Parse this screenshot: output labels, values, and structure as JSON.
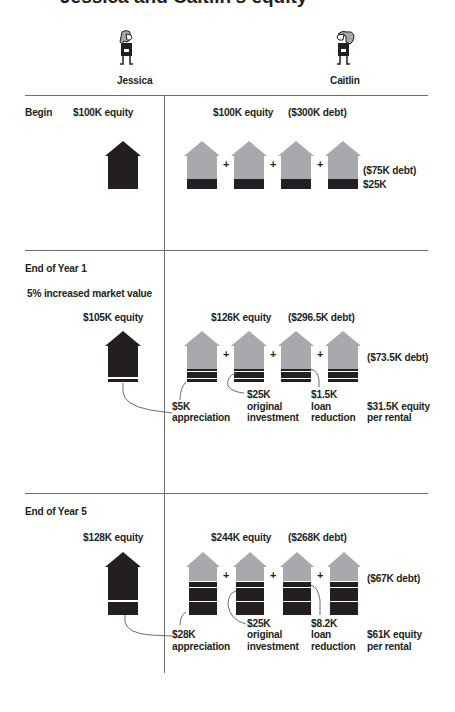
{
  "title": "Jessica and Caitlin's equity",
  "people": {
    "left": {
      "name": "Jessica",
      "icon": "woman-figure-icon"
    },
    "right": {
      "name": "Caitlin",
      "icon": "woman-ponytail-figure-icon"
    }
  },
  "colors": {
    "equity": "#231f20",
    "debt": "#a7a9ac",
    "rule": "#6d6d6d"
  },
  "sections": {
    "begin": {
      "label": "Begin",
      "left_equity": "$100K equity",
      "right_equity": "$100K equity",
      "right_debt": "($300K debt)",
      "per_house_debt": "($75K debt)",
      "per_house_equity": "$25K"
    },
    "year1": {
      "label": "End of Year 1",
      "note": "5% increased market value",
      "left_equity": "$105K equity",
      "right_equity": "$126K equity",
      "right_debt": "($296.5K debt)",
      "per_house_debt": "($73.5K debt)",
      "callouts": {
        "appreciation_amount": "$5K",
        "appreciation_label": "appreciation",
        "original_amount": "$25K",
        "original_label1": "original",
        "original_label2": "investment",
        "loan_amount": "$1.5K",
        "loan_label1": "loan",
        "loan_label2": "reduction",
        "equity_per_rental1": "$31.5K equity",
        "equity_per_rental2": "per rental"
      }
    },
    "year5": {
      "label": "End of Year 5",
      "left_equity": "$128K equity",
      "right_equity": "$244K equity",
      "right_debt": "($268K debt)",
      "per_house_debt": "($67K debt)",
      "callouts": {
        "appreciation_amount": "$28K",
        "appreciation_label": "appreciation",
        "original_amount": "$25K",
        "original_label1": "original",
        "original_label2": "investment",
        "loan_amount": "$8.2K",
        "loan_label1": "loan",
        "loan_label2": "reduction",
        "equity_per_rental1": "$61K equity",
        "equity_per_rental2": "per rental"
      }
    }
  },
  "plus_sign": "+"
}
